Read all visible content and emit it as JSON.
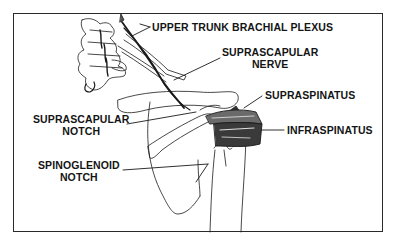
{
  "diagram": {
    "type": "anatomical-illustration",
    "colors": {
      "line": "#1a1a1a",
      "background": "#ffffff",
      "frame": "#2a2a2a"
    },
    "labels": [
      {
        "id": "upper-trunk",
        "lines": [
          "UPPER TRUNK BRACHIAL PLEXUS"
        ]
      },
      {
        "id": "suprascapular-nerve",
        "lines": [
          "SUPRASCAPULAR",
          "NERVE"
        ]
      },
      {
        "id": "supraspinatus",
        "lines": [
          "SUPRASPINATUS"
        ]
      },
      {
        "id": "infraspinatus",
        "lines": [
          "INFRASPINATUS"
        ]
      },
      {
        "id": "suprascapular-notch",
        "lines": [
          "SUPRASCAPULAR",
          "NOTCH"
        ]
      },
      {
        "id": "spinoglenoid-notch",
        "lines": [
          "SPINOGLENOID",
          "NOTCH"
        ]
      }
    ]
  }
}
